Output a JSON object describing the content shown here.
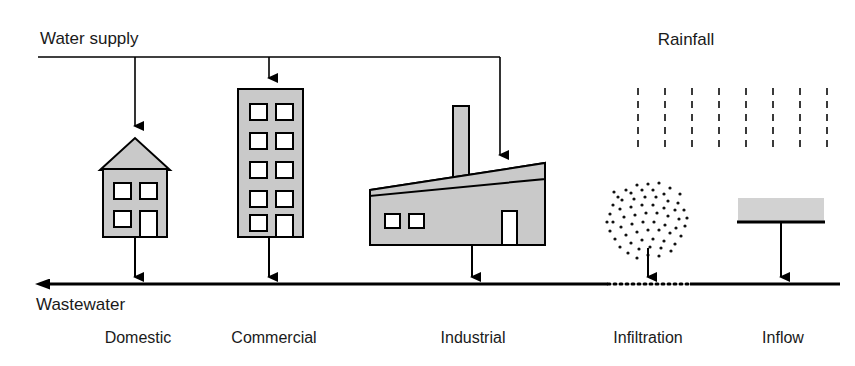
{
  "diagram": {
    "title_labels": {
      "water_supply": "Water supply",
      "rainfall": "Rainfall",
      "wastewater": "Wastewater"
    },
    "captions": [
      {
        "id": "domestic",
        "label": "Domestic"
      },
      {
        "id": "commercial",
        "label": "Commercial"
      },
      {
        "id": "industrial",
        "label": "Industrial"
      },
      {
        "id": "infiltration",
        "label": "Infiltration"
      },
      {
        "id": "inflow",
        "label": "Inflow"
      }
    ],
    "colors": {
      "building_fill": "#c9c9c9",
      "outline": "#000000",
      "window_fill": "#ffffff",
      "rain_dash": "#3a3a3a",
      "inflow_fill": "#d2d2d2",
      "background": "#ffffff"
    },
    "sources": {
      "supplied_by_water_main": [
        "Domestic",
        "Commercial",
        "Industrial"
      ],
      "supplied_by_rainfall": [
        "Infiltration",
        "Inflow"
      ]
    }
  }
}
